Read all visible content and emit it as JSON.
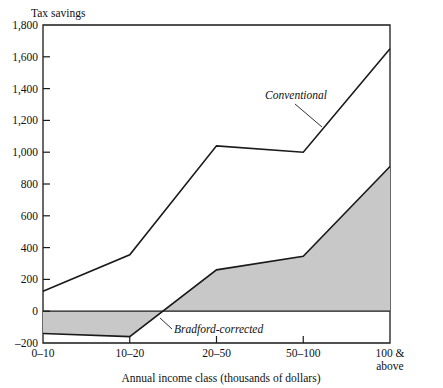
{
  "chart_data": {
    "type": "area",
    "title": "",
    "ylabel": "Tax savings",
    "xlabel": "Annual income class (thousands of dollars)",
    "categories": [
      "0–10",
      "10–20",
      "20–50",
      "50–100",
      "100 &\nabove"
    ],
    "category_labels_line1": [
      "0–10",
      "10–20",
      "20–50",
      "50–100",
      "100 &"
    ],
    "category_labels_line2": [
      "",
      "",
      "",
      "",
      "above"
    ],
    "ylim": [
      -200,
      1800
    ],
    "yticks": [
      -200,
      0,
      200,
      400,
      600,
      800,
      1000,
      1200,
      1400,
      1600,
      1800
    ],
    "ytick_labels": [
      "–200",
      "0",
      "200",
      "400",
      "600",
      "800",
      "1,000",
      "1,200",
      "1,400",
      "1,600",
      "1,800"
    ],
    "grid": false,
    "legend_position": "inline-annotation",
    "zero_line": 0,
    "fill_color": "#c8c8c8",
    "line_color": "#1a1a1a",
    "series": [
      {
        "name": "Conventional",
        "values": [
          125,
          355,
          1040,
          1000,
          1650
        ],
        "style": "line",
        "annotation": "Conventional"
      },
      {
        "name": "Bradford-corrected",
        "values": [
          -140,
          -160,
          260,
          345,
          910
        ],
        "style": "filled-to-zero",
        "annotation": "Bradford-corrected"
      }
    ]
  },
  "annotations": {
    "conventional_label": "Conventional",
    "bradford_label": "Bradford-corrected"
  },
  "axis": {
    "y_title": "Tax savings",
    "x_title": "Annual income class (thousands of dollars)"
  }
}
